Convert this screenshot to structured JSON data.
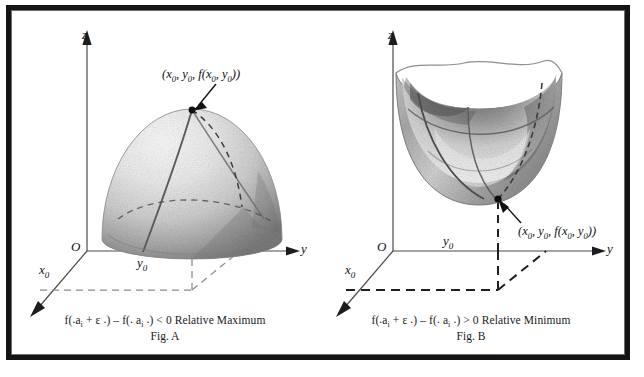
{
  "figure": {
    "panel_count": 2
  },
  "panels": [
    {
      "id": "fig-a",
      "name": "Fig. A",
      "surface": "dome",
      "surface_description": "upper hemisphere / dome shaded grey stipple",
      "extremum_type": "Relative Maximum",
      "point_label": "(x0, y0, f(x0, y0))",
      "point_label_parts": {
        "open": "(",
        "x": "x",
        "x_sub": "0",
        "comma1": ", ",
        "y": "y",
        "y_sub": "0",
        "comma2": ", ",
        "f": "f",
        "fopen": "(",
        "fx": "x",
        "fx_sub": "0",
        "comma3": ", ",
        "fy": "y",
        "fy_sub": "0",
        "fclose": ")",
        "close": ")"
      },
      "axes": {
        "z_label": "z",
        "y_label": "y",
        "origin_label": "O",
        "x0_label": "x",
        "x0_sub": "0",
        "y0_label": "y",
        "y0_sub": "0"
      },
      "caption": {
        "expression": "f(.aᵢ + ε .) – f(. aᵢ .) < 0 Relative Maximum",
        "f1": "f(",
        "dot1": ".",
        "a1": "a",
        "sub1": "i",
        "plus": " + ",
        "epsilon": "ε",
        "dot2": " .",
        "close1": ")",
        "minus": " – ",
        "f2": "f(",
        "dot3": ". ",
        "a2": "a",
        "sub2": "i",
        "dot4": " .",
        "close2": ")",
        "relation": " < 0 Relative Maximum",
        "fig_label": "Fig. A"
      }
    },
    {
      "id": "fig-b",
      "name": "Fig. B",
      "surface": "bowl",
      "surface_description": "paraboloid bowl shaded grey stipple, open top",
      "extremum_type": "Relative Minimum",
      "point_label": "(x0, y0, f(x0, y0))",
      "point_label_parts": {
        "open": "(",
        "x": "x",
        "x_sub": "0",
        "comma1": ", ",
        "y": "y",
        "y_sub": "0",
        "comma2": ", ",
        "f": "f",
        "fopen": "(",
        "fx": "x",
        "fx_sub": "0",
        "comma3": ", ",
        "fy": "y",
        "fy_sub": "0",
        "fclose": ")",
        "close": ")"
      },
      "axes": {
        "z_label": "z",
        "y_label": "y",
        "origin_label": "O",
        "x0_label": "x",
        "x0_sub": "0",
        "y0_label": "y",
        "y0_sub": "0"
      },
      "caption": {
        "expression": "f(.aᵢ + ε .) – f(. aᵢ .) > 0 Relative Minimum",
        "f1": "f(",
        "dot1": ".",
        "a1": "a",
        "sub1": "i",
        "plus": " + ",
        "epsilon": "ε",
        "dot2": " .",
        "close1": ")",
        "minus": " – ",
        "f2": "f(",
        "dot3": ". ",
        "a2": "a",
        "sub2": "i",
        "dot4": " .",
        "close2": ")",
        "relation": " > 0 Relative Minimum",
        "fig_label": "Fig. B"
      }
    }
  ],
  "colors": {
    "frame": "#141414",
    "frame_hairline": "#6e6e6e",
    "ink": "#1a1a1a",
    "axis": "#3a3a3a",
    "dashed_light": "#8b8b8b",
    "dashed_dark": "#222222",
    "surface_light": "#e9e9e9",
    "surface_mid": "#b8b8b8",
    "surface_dark": "#6a6a6a",
    "background": "#ffffff"
  }
}
